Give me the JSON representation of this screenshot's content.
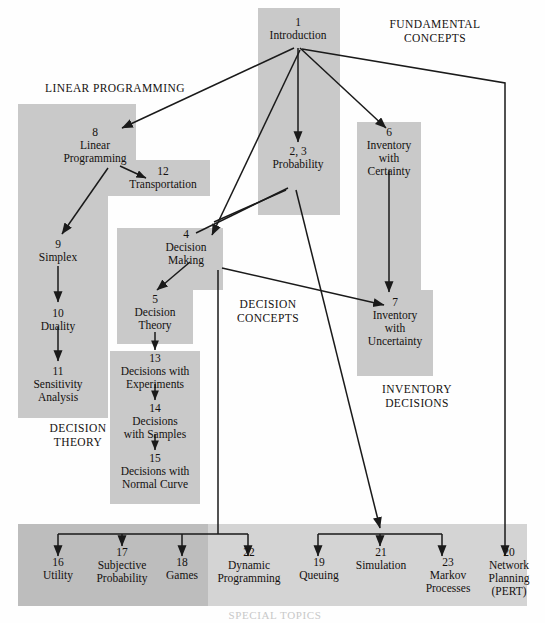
{
  "group_captions": [
    {
      "id": "fundamental-concepts",
      "text": "FUNDAMENTAL\nCONCEPTS",
      "line1": "FUNDAMENTAL",
      "line2": "CONCEPTS",
      "x": 355,
      "y": 18,
      "w": 160
    },
    {
      "id": "linear-programming",
      "text": "LINEAR PROGRAMMING",
      "line1": "LINEAR PROGRAMMING",
      "line2": "",
      "x": 20,
      "y": 82,
      "w": 190
    },
    {
      "id": "decision-concepts",
      "text": "DECISION\nCONCEPTS",
      "line1": "DECISION",
      "line2": "CONCEPTS",
      "x": 208,
      "y": 298,
      "w": 120
    },
    {
      "id": "inventory-decisions",
      "text": "INVENTORY\nDECISIONS",
      "line1": "INVENTORY",
      "line2": "DECISIONS",
      "x": 352,
      "y": 383,
      "w": 130
    },
    {
      "id": "decision-theory",
      "text": "DECISION\nTHEORY",
      "line1": "DECISION",
      "line2": "THEORY",
      "x": 28,
      "y": 422,
      "w": 100
    },
    {
      "id": "special-topics",
      "text": "SPECIAL TOPICS",
      "line1": "SPECIAL TOPICS",
      "line2": "",
      "x": 200,
      "y": 608,
      "w": 150
    }
  ],
  "nodes": [
    {
      "id": "introduction",
      "num": "1",
      "name": "Introduction",
      "x": 252,
      "y": 16,
      "w": 92
    },
    {
      "id": "linear-programming",
      "num": "8",
      "name": "Linear\nProgramming",
      "line1": "Linear",
      "line2": "Programming",
      "x": 40,
      "y": 126,
      "w": 110
    },
    {
      "id": "transportation",
      "num": "12",
      "name": "Transportation",
      "x": 108,
      "y": 165,
      "w": 110
    },
    {
      "id": "probability",
      "num": "2, 3",
      "name": "Probability",
      "x": 252,
      "y": 145,
      "w": 92
    },
    {
      "id": "inventory-certainty",
      "num": "6",
      "name": "Inventory\nwith\nCertainty",
      "line1": "Inventory",
      "line2": "with",
      "line3": "Certainty",
      "x": 360,
      "y": 126,
      "w": 84
    },
    {
      "id": "decision-making",
      "num": "4",
      "name": "Decision\nMaking",
      "line1": "Decision",
      "line2": "Making",
      "x": 152,
      "y": 228,
      "w": 88
    },
    {
      "id": "simplex",
      "num": "9",
      "name": "Simplex",
      "x": 25,
      "y": 238,
      "w": 80
    },
    {
      "id": "decision-theory",
      "num": "5",
      "name": "Decision\nTheory",
      "line1": "Decision",
      "line2": "Theory",
      "x": 118,
      "y": 293,
      "w": 84
    },
    {
      "id": "inventory-uncertainty",
      "num": "7",
      "name": "Inventory\nwith\nUncertainty",
      "line1": "Inventory",
      "line2": "with",
      "line3": "Uncertainty",
      "x": 360,
      "y": 296,
      "w": 92
    },
    {
      "id": "duality",
      "num": "10",
      "name": "Duality",
      "x": 25,
      "y": 307,
      "w": 80
    },
    {
      "id": "sensitivity-analysis",
      "num": "11",
      "name": "Sensitivity\nAnalysis",
      "line1": "Sensitivity",
      "line2": "Analysis",
      "x": 25,
      "y": 365,
      "w": 80
    },
    {
      "id": "decisions-experiments",
      "num": "13",
      "name": "Decisions with\nExperiments",
      "line1": "Decisions with",
      "line2": "Experiments",
      "x": 110,
      "y": 355,
      "w": 100
    },
    {
      "id": "decisions-samples",
      "num": "14",
      "name": "Decisions\nwith Samples",
      "line1": "Decisions",
      "line2": "with Samples",
      "x": 110,
      "y": 405,
      "w": 100
    },
    {
      "id": "decisions-normal-curve",
      "num": "15",
      "name": "Decisions with\nNormal Curve",
      "line1": "Decisions with",
      "line2": "Normal Curve",
      "x": 110,
      "y": 455,
      "w": 100
    },
    {
      "id": "utility",
      "num": "16",
      "name": "Utility",
      "x": 28,
      "y": 557,
      "w": 60
    },
    {
      "id": "subjective-probability",
      "num": "17",
      "name": "Subjective\nProbability",
      "line1": "Subjective",
      "line2": "Probability",
      "x": 90,
      "y": 548,
      "w": 90
    },
    {
      "id": "games",
      "num": "18",
      "name": "Games",
      "x": 180,
      "y": 557,
      "w": 58
    },
    {
      "id": "dynamic-programming",
      "num": "22",
      "name": "Dynamic\nProgramming",
      "line1": "Dynamic",
      "line2": "Programming",
      "x": 238,
      "y": 548,
      "w": 98
    },
    {
      "id": "queuing",
      "num": "19",
      "name": "Queuing",
      "x": 330,
      "y": 557,
      "w": 70
    },
    {
      "id": "simulation",
      "num": "21",
      "name": "Simulation",
      "x": 352,
      "y": 548,
      "w": 88
    },
    {
      "id": "markov-processes",
      "num": "23",
      "name": "Markov\nProcesses",
      "line1": "Markov",
      "line2": "Processes",
      "x": 442,
      "y": 557,
      "w": 76
    },
    {
      "id": "network-planning",
      "num": "20",
      "name": "Network\nPlanning\n(PERT)",
      "line1": "Network",
      "line2": "Planning",
      "line3": "(PERT)",
      "x": 490,
      "y": 548,
      "w": 76
    }
  ],
  "colors": {
    "band_mid": "#c9c9c9",
    "band_light": "#d4d4d4",
    "band_dark": "#bdbdbd",
    "page_background": "#fefefe",
    "line": "#1a1a1a",
    "text": "#14110f"
  },
  "counts": {
    "nodes": 22,
    "group_captions": 6
  }
}
